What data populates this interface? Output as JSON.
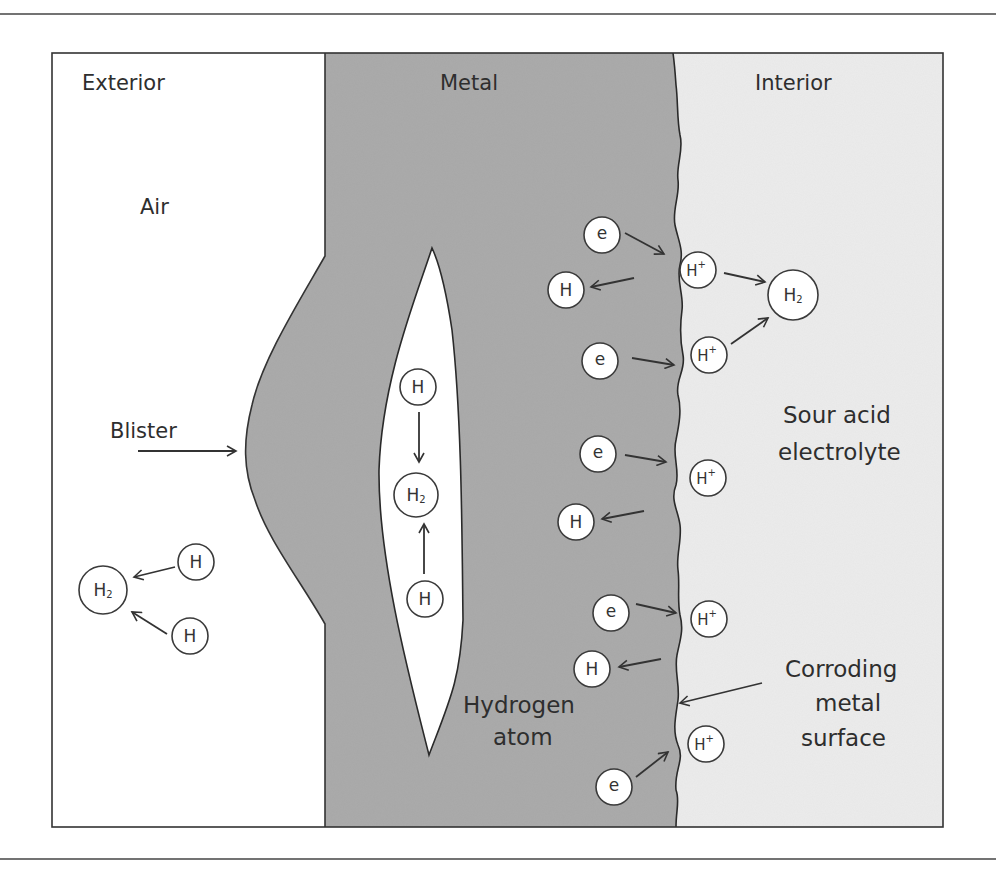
{
  "diagram": {
    "type": "hydrogen-induced blistering schematic",
    "colors": {
      "exterior": "#ffffff",
      "metal": "#a8a8a8",
      "interior": "#ececec",
      "stroke": "#333333"
    },
    "regions": {
      "exterior": {
        "label": "Exterior",
        "medium": "Air"
      },
      "metal": {
        "label": "Metal"
      },
      "interior": {
        "label": "Interior",
        "medium_line1": "Sour acid",
        "medium_line2": "electrolyte"
      }
    },
    "annotations": {
      "blister": "Blister",
      "hydrogen_atom_line1": "Hydrogen",
      "hydrogen_atom_line2": "atom",
      "surface_line1": "Corroding",
      "surface_line2": "metal",
      "surface_line3": "surface"
    },
    "symbols": {
      "electron": "e",
      "hydrogen": "H",
      "hydrogen_ion": "H",
      "ion_charge": "+",
      "h2_base": "H",
      "h2_sub": "2"
    },
    "particles": {
      "exterior": [
        "H2",
        "H",
        "H"
      ],
      "void": [
        "H",
        "H2",
        "H"
      ],
      "metal": [
        "e",
        "H",
        "e",
        "e",
        "H",
        "e",
        "H",
        "e"
      ],
      "interior": [
        "H+",
        "H+",
        "H2",
        "H+",
        "H+",
        "H+"
      ]
    }
  }
}
